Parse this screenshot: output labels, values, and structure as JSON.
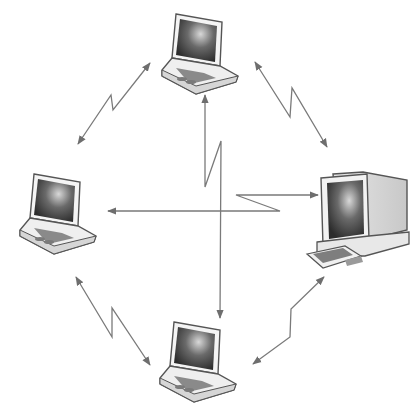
{
  "diagram": {
    "type": "network",
    "nodes": [
      {
        "id": "laptop-top",
        "kind": "laptop",
        "position": "top"
      },
      {
        "id": "laptop-left",
        "kind": "laptop",
        "position": "left"
      },
      {
        "id": "desktop-right",
        "kind": "desktop-computer",
        "position": "right"
      },
      {
        "id": "laptop-bottom",
        "kind": "laptop",
        "position": "bottom"
      }
    ],
    "links": [
      {
        "from": "laptop-top",
        "to": "laptop-left",
        "style": "wireless-bidirectional"
      },
      {
        "from": "laptop-top",
        "to": "desktop-right",
        "style": "wireless-bidirectional"
      },
      {
        "from": "laptop-left",
        "to": "laptop-bottom",
        "style": "wireless-bidirectional"
      },
      {
        "from": "desktop-right",
        "to": "laptop-bottom",
        "style": "wireless-bidirectional"
      },
      {
        "from": "laptop-top",
        "to": "laptop-bottom",
        "style": "wireless-bidirectional"
      },
      {
        "from": "laptop-left",
        "to": "desktop-right",
        "style": "wireless-bidirectional"
      }
    ],
    "colors": {
      "line": "#7a7a7a",
      "device_outline": "#555555",
      "screen": "#3a3a3a",
      "body": "#f2f2f2"
    }
  }
}
